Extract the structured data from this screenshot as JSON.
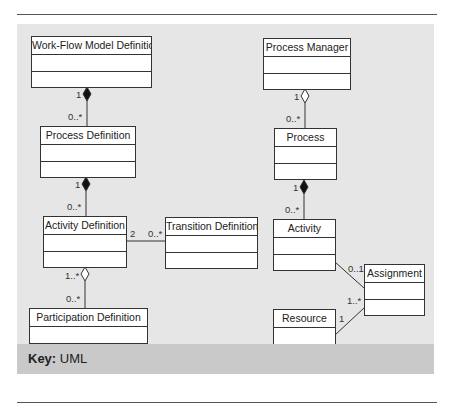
{
  "diagram": {
    "notation": "UML class diagram",
    "classes": [
      {
        "id": "wfmd",
        "name": "Work-Flow Model Definition"
      },
      {
        "id": "pd",
        "name": "Process Definition"
      },
      {
        "id": "ad",
        "name": "Activity Definition"
      },
      {
        "id": "td",
        "name": "Transition Definition"
      },
      {
        "id": "partd",
        "name": "Participation Definition"
      },
      {
        "id": "pm",
        "name": "Process Manager"
      },
      {
        "id": "proc",
        "name": "Process"
      },
      {
        "id": "act",
        "name": "Activity"
      },
      {
        "id": "asg",
        "name": "Assignment"
      },
      {
        "id": "res",
        "name": "Resource"
      }
    ],
    "associations": [
      {
        "from": "Work-Flow Model Definition",
        "to": "Process Definition",
        "kind": "composition",
        "from_mult": "1",
        "to_mult": "0..*"
      },
      {
        "from": "Process Definition",
        "to": "Activity Definition",
        "kind": "composition",
        "from_mult": "1",
        "to_mult": "0..*"
      },
      {
        "from": "Activity Definition",
        "to": "Transition Definition",
        "kind": "association",
        "from_mult": "2",
        "to_mult": "0..*"
      },
      {
        "from": "Activity Definition",
        "to": "Participation Definition",
        "kind": "aggregation",
        "from_mult": "1..*",
        "to_mult": "0..*"
      },
      {
        "from": "Process Manager",
        "to": "Process",
        "kind": "aggregation",
        "from_mult": "1",
        "to_mult": "0..*"
      },
      {
        "from": "Process",
        "to": "Activity",
        "kind": "composition",
        "from_mult": "1",
        "to_mult": "0..*"
      },
      {
        "from": "Activity",
        "to": "Assignment",
        "kind": "association",
        "from_mult": "",
        "to_mult": "0..1"
      },
      {
        "from": "Resource",
        "to": "Assignment",
        "kind": "association",
        "from_mult": "1",
        "to_mult": "1..*"
      }
    ],
    "multiplicities": {
      "wfmd_pd_top": "1",
      "wfmd_pd_bottom": "0..*",
      "pd_ad_top": "1",
      "pd_ad_bottom": "0..*",
      "ad_td_left": "2",
      "ad_td_right": "0..*",
      "ad_part_top": "1..*",
      "ad_part_bottom": "0..*",
      "pm_proc_top": "1",
      "pm_proc_bottom": "0..*",
      "proc_act_top": "1",
      "proc_act_bottom": "0..*",
      "act_asg": "0..1",
      "res_asg": "1..*",
      "res_side": "1"
    }
  },
  "key": {
    "label": "Key:",
    "value": "UML"
  }
}
